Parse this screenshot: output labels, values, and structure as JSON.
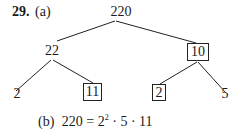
{
  "problem": {
    "number": "29.",
    "part_a_label": "(a)",
    "part_b_label": "(b)"
  },
  "tree": {
    "root": "220",
    "left": "22",
    "right": "10",
    "left_left": "2",
    "left_right": "11",
    "right_left": "2",
    "right_right": "5",
    "boxed_nodes": [
      "10",
      "11",
      "2 (under 10)"
    ]
  },
  "factorization": {
    "lhs": "220",
    "eq": "=",
    "base": "2",
    "exponent": "2",
    "rest": "· 5 · 11"
  }
}
